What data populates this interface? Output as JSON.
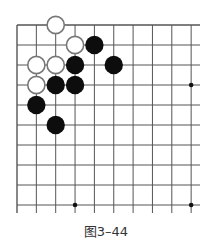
{
  "board": {
    "x0": 17,
    "y0": 25,
    "dx": 19.35,
    "dy": 20,
    "cols": 10,
    "rows": 10,
    "right_open": true,
    "bottom_open": true,
    "line_color": "#555555",
    "star_points": [
      [
        9,
        3
      ],
      [
        3,
        9
      ],
      [
        9,
        9
      ]
    ],
    "white_stones": [
      [
        2,
        0
      ],
      [
        3,
        1
      ],
      [
        1,
        2
      ],
      [
        2,
        2
      ],
      [
        1,
        3
      ]
    ],
    "black_stones": [
      [
        4,
        1
      ],
      [
        3,
        2
      ],
      [
        5,
        2
      ],
      [
        2,
        3
      ],
      [
        3,
        3
      ],
      [
        1,
        4
      ],
      [
        2,
        5
      ]
    ]
  },
  "caption": "图3–44"
}
